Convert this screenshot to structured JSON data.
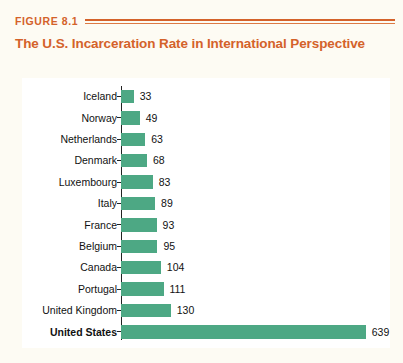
{
  "header": {
    "figure_label": "FIGURE 8.1"
  },
  "chart_data": {
    "type": "bar",
    "orientation": "horizontal",
    "title": "The U.S. Incarceration Rate in International Perspective",
    "xlabel": "",
    "ylabel": "",
    "xlim": [
      0,
      660
    ],
    "grid": false,
    "legend": "none",
    "bar_color": "#4da884",
    "title_color": "#d4622a",
    "label_color": "#d4622a",
    "categories": [
      "Iceland",
      "Norway",
      "Netherlands",
      "Denmark",
      "Luxembourg",
      "Italy",
      "France",
      "Belgium",
      "Canada",
      "Portugal",
      "United Kingdom",
      "United States"
    ],
    "values": [
      33,
      49,
      63,
      68,
      83,
      89,
      93,
      95,
      104,
      111,
      130,
      639
    ],
    "emphasis": [
      "United States"
    ]
  }
}
